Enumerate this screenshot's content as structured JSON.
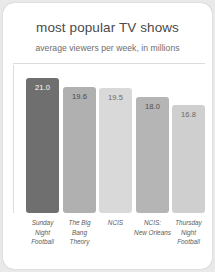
{
  "card": {
    "background": "#ffffff",
    "page_background": "#e9e9e9"
  },
  "header": {
    "title": "most popular TV shows",
    "subtitle": "average viewers per week, in millions"
  },
  "chart_data": {
    "type": "bar",
    "title": "most popular TV shows",
    "subtitle": "average viewers per week, in millions",
    "xlabel": "",
    "ylabel": "",
    "ylim": [
      0,
      23
    ],
    "grid": false,
    "legend": null,
    "categories": [
      "Sunday Night Football",
      "The Big Bang Theory",
      "NCIS",
      "NCIS: New Orleans",
      "Thursday Night Football"
    ],
    "category_lines": [
      [
        "Sunday",
        "Night",
        "Football"
      ],
      [
        "The Big",
        "Bang",
        "Theory"
      ],
      [
        "NCIS"
      ],
      [
        "NCIS:",
        "New Orleans"
      ],
      [
        "Thursday",
        "Night",
        "Football"
      ]
    ],
    "values": [
      21.0,
      19.6,
      19.5,
      18.0,
      16.8
    ],
    "value_labels": [
      "21.0",
      "19.6",
      "19.5",
      "18.0",
      "16.8"
    ],
    "bar_colors": [
      "#6f6f6f",
      "#b0b0b0",
      "#d9d9d9",
      "#b5b5b5",
      "#cfcfcf"
    ],
    "value_label_colors": [
      "#ffffff",
      "#4a4a4a",
      "#6a6a6a",
      "#4f4f4f",
      "#6a6a6a"
    ]
  }
}
